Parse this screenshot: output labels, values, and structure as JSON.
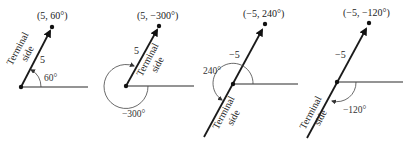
{
  "figure": {
    "panels": [
      {
        "point_label": "(5, 60°)",
        "length_label": "5",
        "angle_label": "60°",
        "terminal_line1": "Terminal",
        "terminal_line2": "side"
      },
      {
        "point_label": "(5, −300°)",
        "length_label": "5",
        "angle_label": "−300°",
        "terminal_line1": "Terminal",
        "terminal_line2": "side"
      },
      {
        "point_label": "(−5, 240°)",
        "length_label": "−5",
        "angle_label": "240°",
        "terminal_line1": "Terminal",
        "terminal_line2": "side"
      },
      {
        "point_label": "(−5, −120°)",
        "length_label": "−5",
        "angle_label": "−120°",
        "terminal_line1": "Terminal",
        "terminal_line2": "side"
      }
    ]
  }
}
